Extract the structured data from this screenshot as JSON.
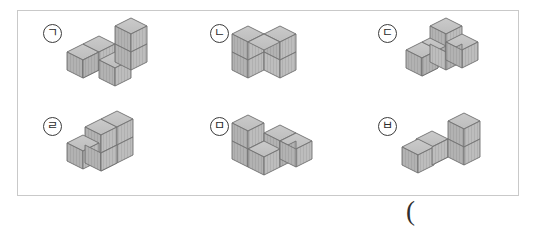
{
  "sheet": {
    "trailing_paren": "(",
    "border_color": "#c9c9c9",
    "background_color": "#ffffff"
  },
  "cube_style": {
    "top_face_color": "#c3c3c3",
    "left_face_color": "#a8a8a8",
    "right_face_color": "#b5b5b5",
    "edge_color": "#6f6f6f"
  },
  "figures": [
    {
      "label": "ㄱ",
      "label_name": "giyeok",
      "cube_count": 4,
      "description": "row of two cubes with one cube in front-right and one cube stacked on the back-right"
    },
    {
      "label": "ㄴ",
      "label_name": "nieun",
      "cube_count": 4,
      "description": "U shape: two bottom cubes with a cube on each end on top"
    },
    {
      "label": "ㄷ",
      "label_name": "digeut",
      "cube_count": 4,
      "description": "T shape of three cubes with one cube stacked on the centre"
    },
    {
      "label": "ㄹ",
      "label_name": "rieul",
      "cube_count": 5,
      "description": "three cubes in a row with two cubes stacked on the right pair"
    },
    {
      "label": "ㅁ",
      "label_name": "mieum",
      "cube_count": 5,
      "description": "staggered arrangement of four cubes with one cube stacked at the back left"
    },
    {
      "label": "ㅂ",
      "label_name": "bieup",
      "cube_count": 4,
      "description": "L shape of three cubes with one cube stacked on the right end"
    }
  ]
}
